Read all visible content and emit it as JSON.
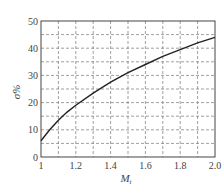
{
  "chart_data": {
    "type": "line",
    "title": "",
    "xlabel": "M_t",
    "xlabel_main": "M",
    "xlabel_sub": "t",
    "ylabel": "σ%",
    "xlim": [
      1.0,
      2.0
    ],
    "ylim": [
      0,
      50
    ],
    "x_ticks": [
      1,
      1.2,
      1.4,
      1.6,
      1.8,
      2.0
    ],
    "x_tick_labels": [
      "1",
      "1.2",
      "1.4",
      "1.6",
      "1.8",
      "2.0"
    ],
    "y_ticks": [
      0,
      10,
      20,
      30,
      40,
      50
    ],
    "y_tick_labels": [
      "0",
      "10",
      "20",
      "30",
      "40",
      "50"
    ],
    "grid": true,
    "grid_style": "dashed",
    "x_grid_step": 0.1,
    "y_grid_step": 5,
    "legend": null,
    "series": [
      {
        "name": "σ%",
        "color": "#222222",
        "x": [
          1.0,
          1.05,
          1.1,
          1.15,
          1.2,
          1.3,
          1.4,
          1.5,
          1.6,
          1.7,
          1.8,
          1.9,
          2.0
        ],
        "y": [
          6.0,
          10.0,
          13.5,
          16.5,
          19.0,
          23.5,
          27.5,
          31.0,
          34.0,
          37.0,
          39.5,
          42.0,
          44.0
        ]
      }
    ]
  },
  "colors": {
    "axis": "#444444",
    "grid": "#777777",
    "curve": "#222222"
  }
}
